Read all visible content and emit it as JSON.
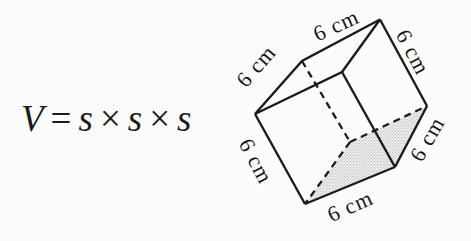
{
  "background_color": "#fcfcfc",
  "formula": {
    "variable": "V",
    "equals_sign": "=",
    "side_symbol": "s",
    "multiply_sign": "×"
  },
  "cube": {
    "figure": "cube",
    "edge_length_value": "6",
    "edge_labels": [
      {
        "position": "top",
        "text": "6 cm"
      },
      {
        "position": "upper-left",
        "text": "6 cm"
      },
      {
        "position": "right",
        "text": "6 cm"
      },
      {
        "position": "lower-left",
        "text": "6 cm"
      },
      {
        "position": "bottom",
        "text": "6 cm"
      },
      {
        "position": "lower-right",
        "text": "6 cm"
      }
    ],
    "line_color": "#1c1c1c",
    "shaded_face": "bottom",
    "shading_style": "light-gray-stipple"
  }
}
